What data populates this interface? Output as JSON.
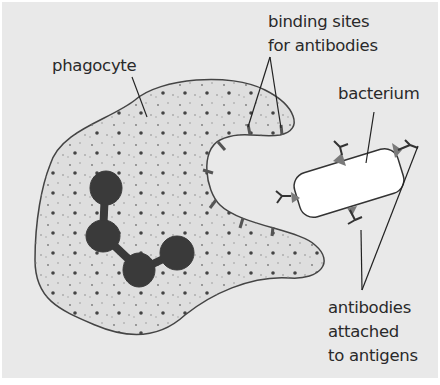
{
  "diagram": {
    "type": "labelled illustration",
    "labels": {
      "phagocyte": "phagocyte",
      "binding_sites_line1": "binding sites",
      "binding_sites_line2": "for antibodies",
      "bacterium": "bacterium",
      "antibodies_line1": "antibodies",
      "antibodies_line2": "attached",
      "antibodies_line3": "to antigens"
    },
    "parts": [
      "phagocyte cell body",
      "nucleus (lobed)",
      "cytoplasm granules",
      "binding sites",
      "bacterium",
      "antibodies",
      "antigens"
    ],
    "colors": {
      "background": "#e9e9e9",
      "cytoplasm": "#dcdcdc",
      "outline": "#333333",
      "nucleus": "#3a3a3a",
      "antigen": "#7a7a7a",
      "bacterium": "#ffffff"
    }
  }
}
